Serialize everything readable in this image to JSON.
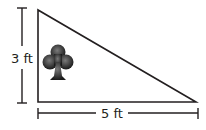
{
  "figure": {
    "type": "right-triangle",
    "height_label": "3 ft",
    "base_label": "5 ft",
    "icon": "club-icon",
    "colors": {
      "stroke": "#231f20",
      "icon_dark": "#1a1a1a",
      "icon_light": "#7a7a7a",
      "background": "#ffffff"
    }
  }
}
